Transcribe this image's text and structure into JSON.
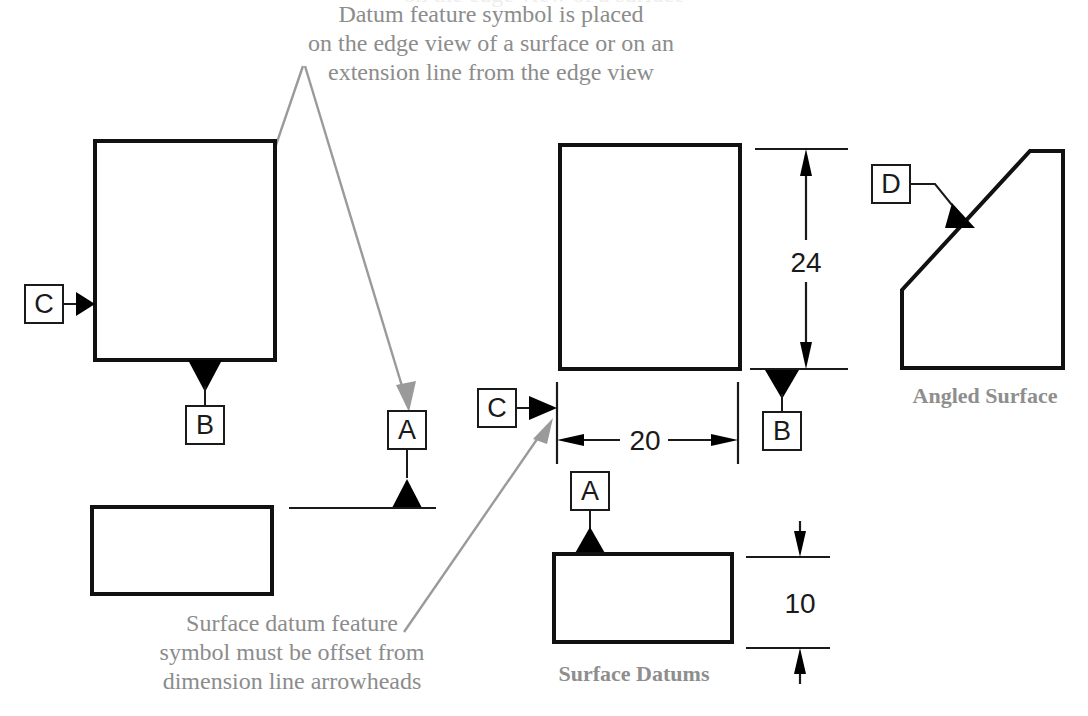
{
  "page": {
    "background": "#ffffff",
    "ink": "#111111",
    "annotation_color": "#8c8c8c",
    "label_color": "#8e8e8e"
  },
  "clipped_top_text": "on the edge view of a surface",
  "callouts": [
    {
      "name": "datum-placement-note",
      "lines": [
        "Datum feature symbol is placed",
        "on the edge view of a surface or on an",
        "extension line from the edge view"
      ]
    },
    {
      "name": "offset-note",
      "lines": [
        "Surface datum feature",
        "symbol must be offset from",
        "dimension line arrowheads"
      ]
    }
  ],
  "view_labels": [
    {
      "name": "surface-datums-label",
      "text": "Surface Datums"
    },
    {
      "name": "angled-surface-label",
      "text": "Angled Surface"
    }
  ],
  "datums": [
    {
      "id": "left-C",
      "letter": "C"
    },
    {
      "id": "left-B",
      "letter": "B"
    },
    {
      "id": "left-A",
      "letter": "A"
    },
    {
      "id": "center-C",
      "letter": "C"
    },
    {
      "id": "center-B",
      "letter": "B"
    },
    {
      "id": "center-A",
      "letter": "A"
    },
    {
      "id": "right-D",
      "letter": "D"
    }
  ],
  "dimensions": [
    {
      "id": "height-24",
      "value": "24",
      "orientation": "vertical"
    },
    {
      "id": "width-20",
      "value": "20",
      "orientation": "horizontal"
    },
    {
      "id": "height-10",
      "value": "10",
      "orientation": "vertical"
    }
  ]
}
